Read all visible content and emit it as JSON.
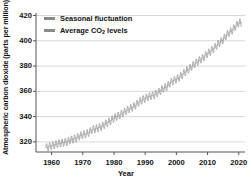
{
  "chart_data": {
    "type": "line",
    "title": "",
    "xlabel": "Year",
    "ylabel": "Atmospheric carbon dioxide (parts per million)",
    "xlim": [
      1955,
      2022
    ],
    "ylim": [
      312,
      422
    ],
    "xticks": [
      1960,
      1970,
      1980,
      1990,
      2000,
      2010,
      2020
    ],
    "yticks": [
      320,
      340,
      360,
      380,
      400,
      420
    ],
    "grid": "horizontal",
    "legend_position": "top-left",
    "legend": [
      {
        "name": "Seasonal fluctuation",
        "color": "#8a8a8a"
      },
      {
        "name": "Average CO2 levels",
        "color": "#8a8a8a"
      }
    ],
    "series": [
      {
        "name": "Average CO2 levels",
        "color": "#9a9a9a",
        "x": [
          1958,
          1959,
          1960,
          1961,
          1962,
          1963,
          1964,
          1965,
          1966,
          1967,
          1968,
          1969,
          1970,
          1971,
          1972,
          1973,
          1974,
          1975,
          1976,
          1977,
          1978,
          1979,
          1980,
          1981,
          1982,
          1983,
          1984,
          1985,
          1986,
          1987,
          1988,
          1989,
          1990,
          1991,
          1992,
          1993,
          1994,
          1995,
          1996,
          1997,
          1998,
          1999,
          2000,
          2001,
          2002,
          2003,
          2004,
          2005,
          2006,
          2007,
          2008,
          2009,
          2010,
          2011,
          2012,
          2013,
          2014,
          2015,
          2016,
          2017,
          2018,
          2019,
          2020
        ],
        "values": [
          315.3,
          315.98,
          316.91,
          317.64,
          318.45,
          318.99,
          319.62,
          320.04,
          321.38,
          322.16,
          323.04,
          324.62,
          325.68,
          326.32,
          327.45,
          329.68,
          330.18,
          331.11,
          332.04,
          333.83,
          335.4,
          336.84,
          338.75,
          340.11,
          341.45,
          343.05,
          344.65,
          346.12,
          347.42,
          349.19,
          351.57,
          353.12,
          354.39,
          355.61,
          356.45,
          357.1,
          358.83,
          360.82,
          362.61,
          363.73,
          366.7,
          368.38,
          369.55,
          371.14,
          373.28,
          375.8,
          377.52,
          379.8,
          381.9,
          383.79,
          385.6,
          387.43,
          389.9,
          391.65,
          393.85,
          396.52,
          398.65,
          400.83,
          404.24,
          406.55,
          408.52,
          411.44,
          414.24
        ]
      },
      {
        "name": "Seasonal fluctuation",
        "color": "#808080",
        "description": "Monthly Mauna Loa record oscillating about the annual mean with a roughly 6 ppm peak-to-trough seasonal cycle, maximum in May and minimum in September.",
        "seasonal_amplitude_ppm": 3.1,
        "seasonal_peak_month": 5,
        "seasonal_trough_month": 9
      }
    ]
  }
}
